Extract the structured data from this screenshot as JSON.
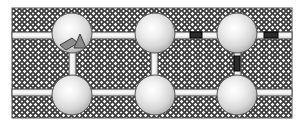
{
  "figure": {
    "background_color": "#ffffff",
    "canvas": {
      "width": 301,
      "height": 130
    }
  },
  "matrix": {
    "name": "hatched-matrix-region",
    "pattern": "cross-hatch",
    "fill_color": "#ffffff",
    "hatch_color": "#3a3a3a",
    "outline_color": "#555555",
    "x": 12,
    "y": 8,
    "width": 280,
    "height": 110
  },
  "bars": {
    "fill_color": "#f2f2f2",
    "stroke_color": "#4d4d4d",
    "horizontal": [
      {
        "name": "horizontal-bar-top",
        "x": 12,
        "y": 32,
        "width": 280,
        "height": 7
      },
      {
        "name": "horizontal-bar-bottom",
        "x": 12,
        "y": 89,
        "width": 280,
        "height": 7
      }
    ],
    "vertical": [
      {
        "name": "vertical-bar-left",
        "x": 69,
        "y": 38,
        "width": 7,
        "height": 54
      },
      {
        "name": "vertical-bar-middle",
        "x": 151,
        "y": 38,
        "width": 7,
        "height": 54
      },
      {
        "name": "vertical-bar-right",
        "x": 234,
        "y": 38,
        "width": 7,
        "height": 54
      }
    ]
  },
  "nodes": [
    {
      "name": "node-top-left",
      "cx": 72,
      "cy": 33,
      "r": 20,
      "row": "top",
      "column": 1
    },
    {
      "name": "node-top-center",
      "cx": 155,
      "cy": 33,
      "r": 20,
      "row": "top",
      "column": 2
    },
    {
      "name": "node-top-right",
      "cx": 237,
      "cy": 33,
      "r": 20,
      "row": "top",
      "column": 3
    },
    {
      "name": "node-bottom-left",
      "cx": 72,
      "cy": 95,
      "r": 20,
      "row": "bottom",
      "column": 1
    },
    {
      "name": "node-bottom-center",
      "cx": 155,
      "cy": 95,
      "r": 20,
      "row": "bottom",
      "column": 2
    },
    {
      "name": "node-bottom-right",
      "cx": 237,
      "cy": 95,
      "r": 20,
      "row": "bottom",
      "column": 3
    }
  ],
  "node_style": {
    "highlight_color": "#ffffff",
    "mid_color": "#dcdcdc",
    "edge_color": "#9a9a9a",
    "stroke_color": "#555555"
  },
  "markers": {
    "fill_color": "#2b2b2b",
    "stroke_color": "#000000",
    "items": [
      {
        "name": "defect-marker-top-bar-left",
        "x": 190,
        "y": 32,
        "width": 12,
        "height": 6,
        "orientation": "horizontal"
      },
      {
        "name": "defect-marker-top-bar-right",
        "x": 264,
        "y": 32,
        "width": 14,
        "height": 6,
        "orientation": "horizontal"
      },
      {
        "name": "defect-marker-vertical-right",
        "x": 234,
        "y": 56,
        "width": 6,
        "height": 15,
        "orientation": "vertical"
      }
    ]
  },
  "inclusions": {
    "fill_color": "#8c8c8c",
    "stroke_color": "#3c3c3c",
    "items": [
      {
        "name": "inclusion-parallelogram",
        "points": "60,45 72,38 78,43 66,50",
        "shape": "parallelogram"
      },
      {
        "name": "inclusion-triangle",
        "points": "80,34 86,48 74,48",
        "shape": "triangle"
      }
    ]
  }
}
